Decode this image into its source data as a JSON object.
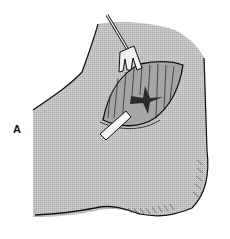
{
  "figure": {
    "panel_label": "A",
    "elements": [
      "tissue-region",
      "incision",
      "retractor",
      "tube-drain",
      "cruciate-cut"
    ],
    "colors": {
      "background": "#ffffff",
      "tissue_fill": "#c4c4c4",
      "outline": "#111111",
      "incision_fill": "#9a9a9a",
      "cut_dark": "#2a2a2a",
      "instrument_fill": "#f2f2f2"
    }
  }
}
